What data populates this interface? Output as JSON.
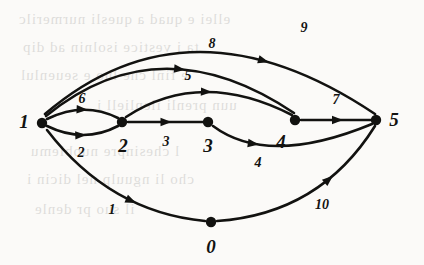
{
  "figure": {
    "type": "directed-graph",
    "background_color": "#fbfaf8",
    "ink_color": "#121210",
    "width": 424,
    "height": 265
  },
  "nodes": [
    {
      "id": "0",
      "label": "0",
      "cx": 211,
      "cy": 222,
      "label_x": 211,
      "label_y": 247
    },
    {
      "id": "1",
      "label": "1",
      "cx": 42,
      "cy": 123,
      "label_x": 24,
      "label_y": 122
    },
    {
      "id": "2",
      "label": "2",
      "cx": 122,
      "cy": 122,
      "label_x": 123,
      "label_y": 146
    },
    {
      "id": "3",
      "label": "3",
      "cx": 208,
      "cy": 122,
      "label_x": 208,
      "label_y": 146
    },
    {
      "id": "4",
      "label": "4",
      "cx": 295,
      "cy": 120,
      "label_x": 281,
      "label_y": 142
    },
    {
      "id": "5",
      "label": "5",
      "cx": 376,
      "cy": 120,
      "label_x": 394,
      "label_y": 120
    }
  ],
  "edges": [
    {
      "label": "1",
      "from": "1",
      "to": "0",
      "path": "M 47 130 Q 110 212 205 221",
      "arrow_t": 0.62,
      "label_x": 112,
      "label_y": 210
    },
    {
      "label": "2",
      "from": "1",
      "to": "2",
      "path": "M 47 126 Q 84 144 118 126",
      "arrow_t": 0.55,
      "label_x": 81,
      "label_y": 153
    },
    {
      "label": "3",
      "from": "2",
      "to": "3",
      "path": "M 128 122 L 203 122",
      "arrow_t": 0.58,
      "label_x": 166,
      "label_y": 142
    },
    {
      "label": "4",
      "from": "3",
      "to": "5",
      "path": "M 213 126 Q 268 167 372 124",
      "arrow_t": 0.3,
      "label_x": 258,
      "label_y": 163
    },
    {
      "label": "5",
      "from": "2",
      "to": "4",
      "path": "M 126 117 Q 200 68 292 115",
      "arrow_t": 0.52,
      "label_x": 188,
      "label_y": 76
    },
    {
      "label": "6",
      "from": "1",
      "to": "2",
      "path": "M 47 119 Q 84 101 118 118",
      "arrow_t": 0.57,
      "label_x": 82,
      "label_y": 99
    },
    {
      "label": "7",
      "from": "4",
      "to": "5",
      "path": "M 301 120 L 371 120",
      "arrow_t": 0.6,
      "label_x": 336,
      "label_y": 100
    },
    {
      "label": "8",
      "from": "1",
      "to": "4",
      "path": "M 46 116 Q 160 23 294 113",
      "arrow_t": 0.56,
      "label_x": 212,
      "label_y": 44
    },
    {
      "label": "9",
      "from": "1",
      "to": "5",
      "path": "M 45 114 Q 190 -10 375 114",
      "arrow_t": 0.67,
      "label_x": 304,
      "label_y": 28
    },
    {
      "label": "10",
      "from": "0",
      "to": "5",
      "path": "M 217 221 Q 320 214 375 126",
      "arrow_t": 0.66,
      "label_x": 322,
      "label_y": 205
    }
  ],
  "ghost_text": [
    {
      "text": "ellei  e  quad  a  quesli  nurmerilc",
      "x": 18,
      "y": 6
    },
    {
      "text": "ta  i  vestice  isolnin  ad  dip",
      "x": 22,
      "y": 34
    },
    {
      "text": "e  finl  che  luo  e  seuenlul",
      "x": 20,
      "y": 62
    },
    {
      "text": "uun  prenli  ilenliell  i",
      "x": 96,
      "y": 92
    },
    {
      "text": "l  chesinpre  nuoblemu",
      "x": 30,
      "y": 138
    },
    {
      "text": "cho  li  nguulp  nel  dicin  i",
      "x": 26,
      "y": 166
    },
    {
      "text": "il  suo  pr  denle",
      "x": 34,
      "y": 196
    }
  ]
}
